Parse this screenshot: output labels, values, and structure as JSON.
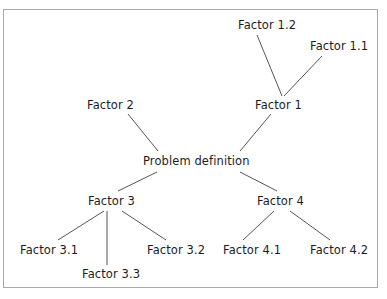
{
  "diagram": {
    "type": "tree",
    "frame": {
      "border_color": "#a9a9a9",
      "background": "#ffffff"
    },
    "text_color": "#1c1c1c",
    "line_color": "#55555a",
    "nodes": [
      {
        "id": "root",
        "label": "Problem definition",
        "x": 143,
        "y": 155
      },
      {
        "id": "factor1",
        "label": "Factor 1",
        "x": 255,
        "y": 99
      },
      {
        "id": "factor1_1",
        "label": "Factor 1.1",
        "x": 310,
        "y": 40
      },
      {
        "id": "factor1_2",
        "label": "Factor 1.2",
        "x": 238,
        "y": 19
      },
      {
        "id": "factor2",
        "label": "Factor 2",
        "x": 87,
        "y": 99
      },
      {
        "id": "factor3",
        "label": "Factor 3",
        "x": 88,
        "y": 195
      },
      {
        "id": "factor3_1",
        "label": "Factor 3.1",
        "x": 20,
        "y": 244
      },
      {
        "id": "factor3_2",
        "label": "Factor 3.2",
        "x": 147,
        "y": 244
      },
      {
        "id": "factor3_3",
        "label": "Factor 3.3",
        "x": 82,
        "y": 268
      },
      {
        "id": "factor4",
        "label": "Factor 4",
        "x": 257,
        "y": 195
      },
      {
        "id": "factor4_1",
        "label": "Factor 4.1",
        "x": 223,
        "y": 244
      },
      {
        "id": "factor4_2",
        "label": "Factor 4.2",
        "x": 310,
        "y": 244
      }
    ],
    "edges": [
      {
        "from": "factor2",
        "to": "root",
        "x1": 128,
        "y1": 114,
        "x2": 158,
        "y2": 151
      },
      {
        "from": "factor1",
        "to": "root",
        "x1": 271,
        "y1": 114,
        "x2": 240,
        "y2": 151
      },
      {
        "from": "factor1_2",
        "to": "factor1",
        "x1": 257,
        "y1": 35,
        "x2": 282,
        "y2": 96
      },
      {
        "from": "factor1_1",
        "to": "factor1",
        "x1": 322,
        "y1": 56,
        "x2": 284,
        "y2": 96
      },
      {
        "from": "root",
        "to": "factor3",
        "x1": 157,
        "y1": 172,
        "x2": 118,
        "y2": 191
      },
      {
        "from": "root",
        "to": "factor4",
        "x1": 240,
        "y1": 172,
        "x2": 277,
        "y2": 191
      },
      {
        "from": "factor3",
        "to": "factor3_1",
        "x1": 104,
        "y1": 211,
        "x2": 58,
        "y2": 240
      },
      {
        "from": "factor3",
        "to": "factor3_3",
        "x1": 107,
        "y1": 211,
        "x2": 107,
        "y2": 265
      },
      {
        "from": "factor3",
        "to": "factor3_2",
        "x1": 122,
        "y1": 211,
        "x2": 166,
        "y2": 240
      },
      {
        "from": "factor4",
        "to": "factor4_1",
        "x1": 274,
        "y1": 211,
        "x2": 243,
        "y2": 240
      },
      {
        "from": "factor4",
        "to": "factor4_2",
        "x1": 290,
        "y1": 211,
        "x2": 330,
        "y2": 240
      }
    ]
  }
}
